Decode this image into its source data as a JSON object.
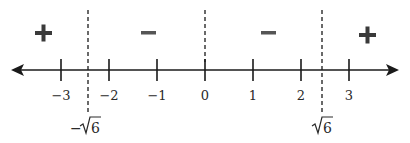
{
  "diagram": {
    "type": "sign-chart-number-line",
    "axis": {
      "min_label": -3,
      "max_label": 3,
      "arrows": "both"
    },
    "ticks": [
      {
        "value": -3,
        "label": "−3",
        "x": 61
      },
      {
        "value": -2,
        "label": "−2",
        "x": 109
      },
      {
        "value": -1,
        "label": "−1",
        "x": 157
      },
      {
        "value": 0,
        "label": "0",
        "x": 205
      },
      {
        "value": 1,
        "label": "1",
        "x": 253
      },
      {
        "value": 2,
        "label": "2",
        "x": 301
      },
      {
        "value": 3,
        "label": "3",
        "x": 349
      }
    ],
    "critical_points": [
      {
        "label_prefix": "−",
        "label_radicand": "6",
        "value": -2.449,
        "x": 88
      },
      {
        "label_prefix": "",
        "label_radicand": "6",
        "value": 2.449,
        "x": 322
      }
    ],
    "zero_divider": {
      "value": 0,
      "x": 205
    },
    "signs": [
      {
        "interval": "(-inf, -√6)",
        "sign": "+",
        "x": 43
      },
      {
        "interval": "(-√6, 0)",
        "sign": "−",
        "x": 148
      },
      {
        "interval": "(0, √6)",
        "sign": "−",
        "x": 268
      },
      {
        "interval": "(√6, inf)",
        "sign": "+",
        "x": 369
      }
    ],
    "colors": {
      "line": "#1a1a1a",
      "text": "#2a2a2a",
      "sign": "#3a3a3a"
    }
  }
}
